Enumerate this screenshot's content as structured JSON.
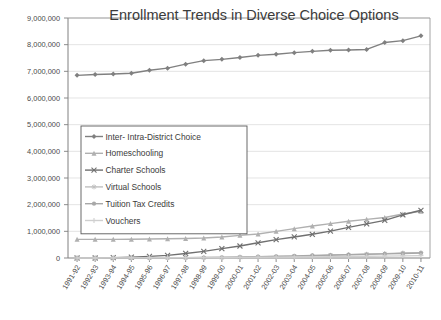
{
  "chart_data": {
    "type": "line",
    "title": "Enrollment Trends in Diverse Choice Options",
    "xlabel": "",
    "ylabel": "",
    "ylim": [
      0,
      9000000
    ],
    "ytick_labels": [
      "9,000,000",
      "8,000,000",
      "7,000,000",
      "6,000,000",
      "5,000,000",
      "4,000,000",
      "3,000,000",
      "2,000,000",
      "1,000,000",
      "0"
    ],
    "ytick_values": [
      9000000,
      8000000,
      7000000,
      6000000,
      5000000,
      4000000,
      3000000,
      2000000,
      1000000,
      0
    ],
    "grid": true,
    "legend_position": "center-left",
    "categories": [
      "1991-92",
      "1992-93",
      "1993-94",
      "1994-95",
      "1995-96",
      "1996-97",
      "1997-98",
      "1998-99",
      "1999-00",
      "2000-01",
      "2001-02",
      "2002-03",
      "2003-04",
      "2004-05",
      "2005-06",
      "2006-07",
      "2007-08",
      "2008-09",
      "2009-10",
      "2010-11"
    ],
    "series": [
      {
        "name": "Inter- Intra-District Choice",
        "color": "#808080",
        "marker": "diamond",
        "values": [
          6850000,
          6880000,
          6900000,
          6930000,
          7040000,
          7120000,
          7270000,
          7400000,
          7450000,
          7520000,
          7600000,
          7640000,
          7700000,
          7750000,
          7790000,
          7800000,
          7820000,
          8080000,
          8150000,
          8330000
        ]
      },
      {
        "name": "Homeschooling",
        "color": "#b0b0b0",
        "marker": "triangle",
        "values": [
          700000,
          700000,
          700000,
          705000,
          710000,
          720000,
          730000,
          750000,
          790000,
          850000,
          900000,
          1000000,
          1100000,
          1200000,
          1290000,
          1380000,
          1450000,
          1520000,
          1650000,
          1750000
        ]
      },
      {
        "name": "Charter Schools",
        "color": "#707070",
        "marker": "cross",
        "values": [
          0,
          0,
          10000,
          30000,
          60000,
          100000,
          170000,
          250000,
          350000,
          450000,
          570000,
          690000,
          790000,
          890000,
          1010000,
          1150000,
          1280000,
          1410000,
          1620000,
          1790000
        ]
      },
      {
        "name": "Virtual Schools",
        "color": "#c0c0c0",
        "marker": "star",
        "values": [
          0,
          0,
          0,
          0,
          0,
          0,
          0,
          5000,
          10000,
          20000,
          30000,
          45000,
          60000,
          80000,
          100000,
          120000,
          140000,
          165000,
          185000,
          200000
        ]
      },
      {
        "name": "Tuition Tax Credits",
        "color": "#a8a8a8",
        "marker": "circle",
        "values": [
          0,
          0,
          0,
          0,
          0,
          5000,
          10000,
          18000,
          28000,
          40000,
          52000,
          65000,
          80000,
          95000,
          110000,
          125000,
          140000,
          155000,
          170000,
          185000
        ]
      },
      {
        "name": "Vouchers",
        "color": "#cfcfcf",
        "marker": "plus",
        "values": [
          0,
          2000,
          4000,
          6000,
          8000,
          10000,
          13000,
          16000,
          20000,
          24000,
          28000,
          33000,
          38000,
          44000,
          50000,
          57000,
          64000,
          72000,
          80000,
          90000
        ]
      }
    ]
  }
}
